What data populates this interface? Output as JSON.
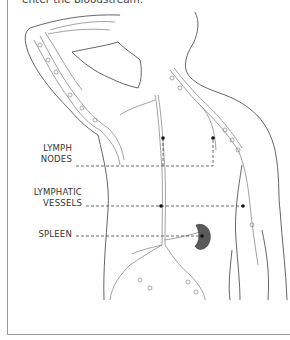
{
  "caption": "enter the bloodstream.",
  "labels": {
    "lymph_nodes": [
      "LYMPH",
      "NODES"
    ],
    "lymphatic_vessels": [
      "LYMPHATIC",
      "VESSELS"
    ],
    "spleen": [
      "SPLEEN"
    ]
  },
  "colors": {
    "outline": "#555555",
    "vessel": "#8a8a8a",
    "spleen": "#5a5a5a",
    "leader": "#444444",
    "border": "#9a9a9a"
  }
}
